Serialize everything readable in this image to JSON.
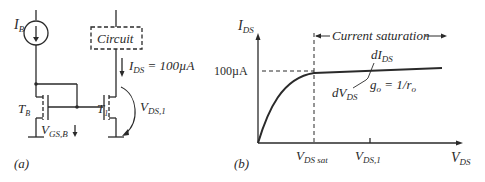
{
  "panel_a": {
    "caption": "(a)",
    "current_source_label": "I",
    "current_source_sub": "B",
    "circuit_box_label": "Circuit",
    "ids_label": "I",
    "ids_sub": "DS",
    "ids_value": " = 100µA",
    "tb_label": "T",
    "tb_sub": "B",
    "t1_label": "T",
    "t1_sub": "1",
    "vgs_label": "V",
    "vgs_sub": "GS,B",
    "vds1_label": "V",
    "vds1_sub": "DS,1"
  },
  "panel_b": {
    "caption": "(b)",
    "y_axis_label": "I",
    "y_axis_sub": "DS",
    "x_axis_label": "V",
    "x_axis_sub": "DS",
    "y_tick": "100µA",
    "x_tick_sat": "V",
    "x_tick_sat_sub": "DS sat",
    "x_tick_1": "V",
    "x_tick_1_sub": "DS,1",
    "region_label": "Current saturation",
    "dI_label": "dI",
    "dI_sub": "DS",
    "dV_label": "dV",
    "dV_sub": "DS",
    "go_label": "g",
    "go_sub": "o",
    "go_eq": " = 1/r",
    "go_eq_sub": "o"
  },
  "colors": {
    "stroke": "#2a2a2a",
    "background": "#ffffff"
  }
}
